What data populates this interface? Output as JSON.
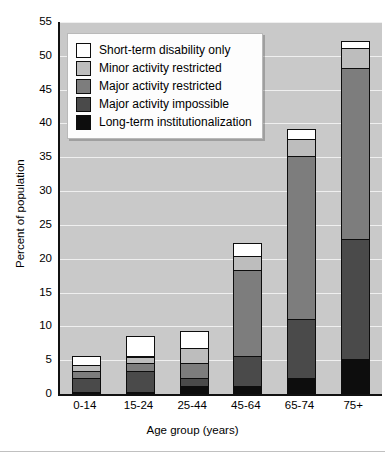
{
  "chart_data": {
    "type": "bar",
    "subtype": "stacked-bar",
    "title": "",
    "xlabel": "Age group (years)",
    "ylabel": "Percent of population",
    "categories": [
      "0-14",
      "15-24",
      "25-44",
      "45-64",
      "65-74",
      "75+"
    ],
    "ylim": [
      0,
      55
    ],
    "yticks": [
      0,
      5,
      10,
      15,
      20,
      25,
      30,
      35,
      40,
      45,
      50,
      55
    ],
    "grid": true,
    "legend_position": "top-left",
    "series": [
      {
        "name": "Long-term institutionalization",
        "color": "#0d0d0d",
        "values": [
          0.2,
          0.2,
          1.0,
          1.0,
          2.2,
          5.0
        ]
      },
      {
        "name": "Major activity impossible",
        "color": "#4a4a4a",
        "values": [
          2.0,
          3.0,
          1.2,
          4.5,
          8.8,
          17.8
        ]
      },
      {
        "name": "Major activity restricted",
        "color": "#7d7d7d",
        "values": [
          1.0,
          1.2,
          2.2,
          12.7,
          24.0,
          25.2
        ]
      },
      {
        "name": "Minor activity restricted",
        "color": "#bdbdbd",
        "values": [
          1.0,
          1.0,
          2.2,
          2.0,
          2.5,
          3.0
        ]
      },
      {
        "name": "Short-term disability only",
        "color": "#ffffff",
        "values": [
          1.3,
          3.0,
          2.6,
          2.0,
          1.5,
          1.0
        ]
      }
    ],
    "totals": [
      5.5,
      8.4,
      9.2,
      22.2,
      39.0,
      52.0
    ],
    "legend": [
      {
        "label": "Short-term disability only",
        "color": "#ffffff"
      },
      {
        "label": "Minor activity restricted",
        "color": "#bdbdbd"
      },
      {
        "label": "Major activity restricted",
        "color": "#7d7d7d"
      },
      {
        "label": "Major activity impossible",
        "color": "#4a4a4a"
      },
      {
        "label": "Long-term institutionalization",
        "color": "#0d0d0d"
      }
    ],
    "plot_background": "#c9c9c9",
    "gridline_color": "#efefef"
  }
}
